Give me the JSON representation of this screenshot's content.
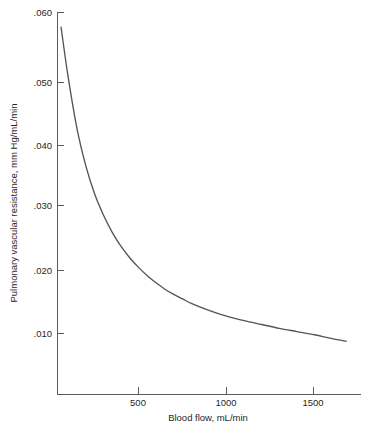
{
  "chart_data": {
    "type": "line",
    "title": "",
    "xlabel": "Blood flow, mL/min",
    "ylabel": "Pulmonary vascular resistance, mm Hg/mL/min",
    "xlim": [
      0,
      1750
    ],
    "ylim": [
      0,
      0.062
    ],
    "grid": false,
    "legend": null,
    "x_ticks": [
      500,
      1000,
      1500
    ],
    "x_tick_labels": [
      "500",
      "1000",
      "1500"
    ],
    "y_ticks": [
      0.01,
      0.02,
      0.03,
      0.04,
      0.05,
      0.06
    ],
    "y_tick_labels": [
      ".010",
      ".020",
      ".030",
      ".040",
      ".050",
      ".060"
    ],
    "series": [
      {
        "name": "Pulmonary vascular resistance",
        "color": "#555555",
        "x": [
          60,
          100,
          150,
          200,
          250,
          300,
          350,
          400,
          450,
          500,
          550,
          600,
          650,
          700,
          750,
          800,
          900,
          1000,
          1100,
          1200,
          1300,
          1400,
          1500,
          1600,
          1680
        ],
        "y": [
          0.0577,
          0.05,
          0.042,
          0.0362,
          0.0318,
          0.0285,
          0.0258,
          0.0236,
          0.0218,
          0.0203,
          0.019,
          0.0179,
          0.0169,
          0.0161,
          0.0154,
          0.0147,
          0.0136,
          0.0127,
          0.012,
          0.0114,
          0.0108,
          0.0103,
          0.0098,
          0.0092,
          0.0088
        ]
      }
    ]
  },
  "axes": {
    "y_axis_title": "Pulmonary vascular resistance, mm Hg/mL/min",
    "x_axis_title": "Blood flow, mL/min"
  }
}
